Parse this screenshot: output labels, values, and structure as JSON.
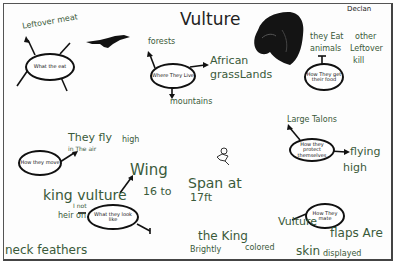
{
  "poster": {
    "title": "Vulture",
    "author": "Declan",
    "bubbles": {
      "what_they_eat": {
        "label": "What the eat",
        "branches": [
          "Leftover meat"
        ]
      },
      "where_they_live": {
        "label": "Where They Live",
        "branches": [
          "forests",
          "African grass Lands",
          "mountains"
        ]
      },
      "how_they_get_food": {
        "label": "How They get their food",
        "branches": [
          "they Eat other animals Leftover kill"
        ]
      },
      "how_they_move": {
        "label": "How they move",
        "branches": [
          "They fly in The air high"
        ]
      },
      "how_they_protect": {
        "label": "How they protect themselves",
        "branches": [
          "Large Talons",
          "flying high"
        ]
      },
      "what_they_look_like": {
        "label": "What they look like",
        "branches": [
          "king vulture",
          "Wing span at 16 to 17ft",
          "I not heir on",
          "neck feathers"
        ]
      },
      "how_they_mate": {
        "label": "How They mate",
        "branches": [
          "Vulture"
        ]
      }
    },
    "texts": {
      "leftover_meat": "Leftover meat",
      "forests": "forests",
      "african": "African",
      "grasslands": "grassLands",
      "mountains": "mountains",
      "they_eat": "they Eat",
      "other": "other",
      "animals": "animals",
      "leftover": "Leftover",
      "kill": "kill",
      "they_fly": "They fly",
      "in_the_air": "in The air",
      "high": "high",
      "large_talons": "Large Talons",
      "flying": "flying",
      "high2": "high",
      "king_vulture": "king vulture",
      "wing": "Wing",
      "span_at": "Span at",
      "sixteen_to": "16 to",
      "seventeen_ft": "17ft",
      "not": "I not",
      "heir_on": "heir on",
      "neck_feathers": "neck feathers",
      "the_king": "the King",
      "brightly": "Brightly",
      "colored": "colored",
      "vulture_small": "Vulture",
      "flaps_are": "flaps Are",
      "skin": "skin",
      "displayed": "displayed"
    },
    "drawings": [
      "flying-bird-silhouette",
      "vulture-head-drawing",
      "small-bird-doodle"
    ]
  }
}
